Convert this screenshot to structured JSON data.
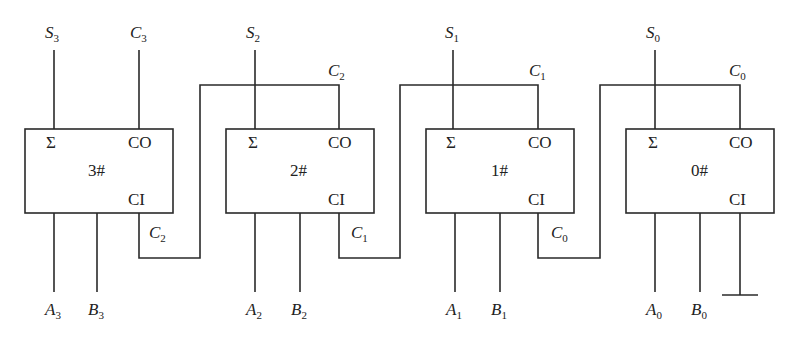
{
  "diagram": {
    "stroke_color": "#2a2a2a",
    "adders": [
      {
        "id": "3#",
        "name": "3#",
        "sum_label": "Σ",
        "carry_out_label": "CO",
        "carry_in_label": "CI",
        "top_signals": [
          {
            "main": "S",
            "sub": "3"
          },
          {
            "main": "C",
            "sub": "3"
          }
        ],
        "bottom_signals": [
          {
            "main": "A",
            "sub": "3"
          },
          {
            "main": "B",
            "sub": "3"
          }
        ],
        "carry_in_wire_label": {
          "main": "C",
          "sub": "2"
        }
      },
      {
        "id": "2#",
        "name": "2#",
        "sum_label": "Σ",
        "carry_out_label": "CO",
        "carry_in_label": "CI",
        "top_signals": [
          {
            "main": "S",
            "sub": "2"
          }
        ],
        "carry_out_wire_label": {
          "main": "C",
          "sub": "2"
        },
        "bottom_signals": [
          {
            "main": "A",
            "sub": "2"
          },
          {
            "main": "B",
            "sub": "2"
          }
        ],
        "carry_in_wire_label": {
          "main": "C",
          "sub": "1"
        }
      },
      {
        "id": "1#",
        "name": "1#",
        "sum_label": "Σ",
        "carry_out_label": "CO",
        "carry_in_label": "CI",
        "top_signals": [
          {
            "main": "S",
            "sub": "1"
          }
        ],
        "carry_out_wire_label": {
          "main": "C",
          "sub": "1"
        },
        "bottom_signals": [
          {
            "main": "A",
            "sub": "1"
          },
          {
            "main": "B",
            "sub": "1"
          }
        ],
        "carry_in_wire_label": {
          "main": "C",
          "sub": "0"
        }
      },
      {
        "id": "0#",
        "name": "0#",
        "sum_label": "Σ",
        "carry_out_label": "CO",
        "carry_in_label": "CI",
        "top_signals": [
          {
            "main": "S",
            "sub": "0"
          }
        ],
        "carry_out_wire_label": {
          "main": "C",
          "sub": "0"
        },
        "bottom_signals": [
          {
            "main": "A",
            "sub": "0"
          },
          {
            "main": "B",
            "sub": "0"
          }
        ],
        "carry_in": "ground"
      }
    ]
  }
}
